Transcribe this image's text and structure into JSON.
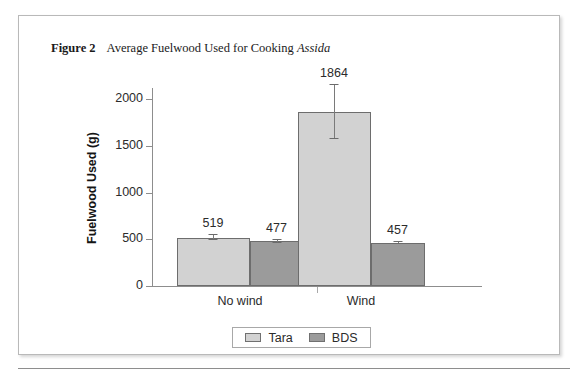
{
  "figure": {
    "label": "Figure 2",
    "caption_text": "Average Fuelwood Used for Cooking ",
    "caption_italic": "Assida"
  },
  "chart_data": {
    "type": "bar",
    "title": "Average Fuelwood Used for Cooking Assida",
    "xlabel": "",
    "ylabel": "Fuelwood Used (g)",
    "categories": [
      "No wind",
      "Wind"
    ],
    "series": [
      {
        "name": "Tara",
        "color": "#d2d2d2",
        "values": [
          519,
          1864
        ],
        "errors": [
          30,
          290
        ]
      },
      {
        "name": "BDS",
        "color": "#9b9b9b",
        "values": [
          477,
          457
        ],
        "errors": [
          14,
          12
        ]
      }
    ],
    "ylim": [
      0,
      2100
    ],
    "yticks": [
      0,
      500,
      1000,
      1500,
      2000
    ],
    "ytick_labels": [
      "0",
      "500",
      "1000",
      "1500",
      "2000"
    ],
    "grid": false,
    "legend_position": "bottom",
    "data_labels": [
      "519",
      "477",
      "1864",
      "457"
    ]
  },
  "legend": {
    "items": [
      {
        "label": "Tara",
        "color": "#d2d2d2"
      },
      {
        "label": "BDS",
        "color": "#9b9b9b"
      }
    ]
  }
}
